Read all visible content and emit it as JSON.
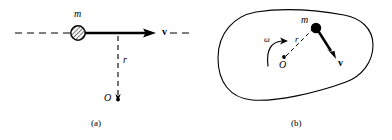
{
  "figure": {
    "type": "physics-diagram",
    "stroke_color": "#000000",
    "background_color": "#ffffff"
  },
  "panel_a": {
    "caption": "(a)",
    "labels": {
      "mass": "m",
      "velocity": "v",
      "radius": "r",
      "origin": "O"
    },
    "elements": {
      "horizontal_dashed_line": "line-of-motion",
      "mass_marker": "hatched-circle",
      "velocity_arrow": "solid-arrow-right",
      "radius_line": "vertical-dashed-line",
      "origin_point": "dot"
    }
  },
  "panel_b": {
    "caption": "(b)",
    "labels": {
      "mass": "m",
      "velocity": "v",
      "radius": "r",
      "origin": "O",
      "angular_velocity": "ω"
    },
    "elements": {
      "body_outline": "closed-blob-curve",
      "mass_marker": "filled-dot",
      "velocity_arrow": "solid-arrow-down-right",
      "radius_line": "dashed-line",
      "origin_point": "dot",
      "rotation_arrow": "curved-arrow-counterclockwise"
    }
  }
}
